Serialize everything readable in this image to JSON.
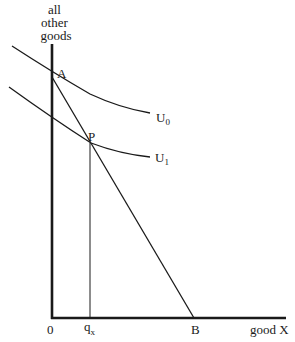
{
  "diagram": {
    "type": "indifference-curve-budget-constraint",
    "y_axis_label": [
      "all",
      "other",
      "goods"
    ],
    "x_axis_label": "good X",
    "origin_label": "0",
    "points": {
      "A": {
        "label": "A"
      },
      "P": {
        "label": "P"
      },
      "B": {
        "label": "B"
      }
    },
    "qx_label": {
      "base": "q",
      "sub": "x"
    },
    "curves": [
      {
        "name": "U0",
        "base": "U",
        "sub": "0"
      },
      {
        "name": "U1",
        "base": "U",
        "sub": "1"
      }
    ],
    "colors": {
      "line": "#1a1a1a",
      "background": "#ffffff"
    }
  }
}
